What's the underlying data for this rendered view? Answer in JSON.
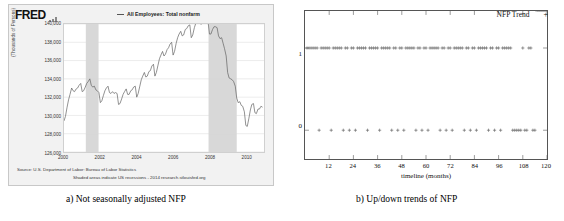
{
  "figure_a": {
    "brand": "FRED",
    "brand_icon": "bar-chart-mark",
    "legend": "All Employees: Total nonfarm",
    "legend_marker": "line-dash",
    "ylabel": "(Thousands of Persons)",
    "yticks": [
      "140,000",
      "138,000",
      "136,000",
      "134,000",
      "132,000",
      "130,000",
      "128,000",
      "126,000"
    ],
    "xticks": [
      "2000",
      "2002",
      "2004",
      "2006",
      "2008",
      "2010"
    ],
    "source_line1": "Source: U.S. Department of Labor: Bureau of Labor Statistics",
    "source_line2": "Shaded areas indicate US recessions - 2014 research.stlouisfed.org",
    "caption": "a) Not seasonally adjusted NFP"
  },
  "figure_b": {
    "legend_label": "NFP Trend",
    "legend_marker": "+",
    "yticks": [
      "1",
      "0"
    ],
    "xticks": [
      "12",
      "24",
      "36",
      "48",
      "60",
      "72",
      "84",
      "96",
      "108",
      "120"
    ],
    "xlabel": "timeline (months)",
    "caption": "b) Up/down trends of NFP"
  },
  "colors": {
    "fred_panel_bg": "#f2f2f2",
    "plot_bg": "#ffffff",
    "series_line": "#555555",
    "recession_band": "#d8d8d8",
    "gridline": "#d9d9d9",
    "frame": "#555555",
    "text": "#111111"
  },
  "chart_data": [
    {
      "type": "line",
      "title": "All Employees: Total nonfarm",
      "xlabel": "",
      "ylabel": "(Thousands of Persons)",
      "ylim": [
        126000,
        140000
      ],
      "xlim": [
        2000.0,
        2011.0
      ],
      "ytick_values": [
        126000,
        128000,
        130000,
        132000,
        134000,
        136000,
        138000,
        140000
      ],
      "xtick_values": [
        2000,
        2002,
        2004,
        2006,
        2008,
        2010
      ],
      "grid": true,
      "legend_position": "top",
      "shaded_regions": [
        {
          "label": "US recession",
          "x0": 2001.2,
          "x1": 2001.9
        },
        {
          "label": "US recession",
          "x0": 2007.95,
          "x1": 2009.5
        }
      ],
      "series": [
        {
          "name": "All Employees: Total nonfarm",
          "x": [
            2000.0,
            2000.08,
            2000.17,
            2000.25,
            2000.33,
            2000.42,
            2000.5,
            2000.58,
            2000.67,
            2000.75,
            2000.83,
            2000.92,
            2001.0,
            2001.08,
            2001.17,
            2001.25,
            2001.33,
            2001.42,
            2001.5,
            2001.58,
            2001.67,
            2001.75,
            2001.83,
            2001.92,
            2002.0,
            2002.08,
            2002.17,
            2002.25,
            2002.33,
            2002.42,
            2002.5,
            2002.58,
            2002.67,
            2002.75,
            2002.83,
            2002.92,
            2003.0,
            2003.08,
            2003.17,
            2003.25,
            2003.33,
            2003.42,
            2003.5,
            2003.58,
            2003.67,
            2003.75,
            2003.83,
            2003.92,
            2004.0,
            2004.08,
            2004.17,
            2004.25,
            2004.33,
            2004.42,
            2004.5,
            2004.58,
            2004.67,
            2004.75,
            2004.83,
            2004.92,
            2005.0,
            2005.08,
            2005.17,
            2005.25,
            2005.33,
            2005.42,
            2005.5,
            2005.58,
            2005.67,
            2005.75,
            2005.83,
            2005.92,
            2006.0,
            2006.08,
            2006.17,
            2006.25,
            2006.33,
            2006.42,
            2006.5,
            2006.58,
            2006.67,
            2006.75,
            2006.83,
            2006.92,
            2007.0,
            2007.08,
            2007.17,
            2007.25,
            2007.33,
            2007.42,
            2007.5,
            2007.58,
            2007.67,
            2007.75,
            2007.83,
            2007.92,
            2008.0,
            2008.08,
            2008.17,
            2008.25,
            2008.33,
            2008.42,
            2008.5,
            2008.58,
            2008.67,
            2008.75,
            2008.83,
            2008.92,
            2009.0,
            2009.08,
            2009.17,
            2009.25,
            2009.33,
            2009.42,
            2009.5,
            2009.58,
            2009.67,
            2009.75,
            2009.83,
            2009.92,
            2010.0,
            2010.08,
            2010.17,
            2010.25,
            2010.33,
            2010.42,
            2010.5,
            2010.58,
            2010.67,
            2010.75,
            2010.83,
            2010.92
          ],
          "y": [
            129400,
            129900,
            130900,
            131700,
            132300,
            133000,
            132700,
            132600,
            132900,
            133000,
            133300,
            133500,
            132600,
            132700,
            133100,
            133500,
            133700,
            134000,
            133300,
            133100,
            133200,
            132800,
            132700,
            132500,
            131400,
            131600,
            132200,
            132700,
            133000,
            133200,
            132500,
            132400,
            132600,
            132400,
            132500,
            132400,
            131200,
            131300,
            131800,
            132300,
            132600,
            132900,
            132300,
            132300,
            132700,
            132800,
            133100,
            133200,
            132000,
            132400,
            133200,
            133900,
            134300,
            134700,
            134200,
            134300,
            134800,
            134900,
            135400,
            135600,
            134300,
            134700,
            135500,
            136200,
            136600,
            137000,
            136500,
            136700,
            137200,
            137400,
            137800,
            138000,
            136600,
            137000,
            137900,
            138500,
            138900,
            139200,
            138700,
            138800,
            139400,
            139500,
            139800,
            139900,
            138500,
            138800,
            139600,
            140100,
            140400,
            140600,
            140000,
            140000,
            140400,
            140300,
            140400,
            140300,
            138900,
            138900,
            139400,
            139700,
            139700,
            139600,
            138700,
            138400,
            138500,
            137900,
            137300,
            136500,
            134700,
            134100,
            134000,
            133900,
            133700,
            133200,
            131900,
            131400,
            131500,
            131100,
            131000,
            130400,
            128900,
            128800,
            129700,
            130600,
            131200,
            131300,
            130300,
            130200,
            130700,
            130700,
            131000,
            130900
          ]
        }
      ]
    },
    {
      "type": "scatter",
      "title": "",
      "xlabel": "timeline (months)",
      "ylabel": "",
      "ylim": [
        -0.35,
        1.45
      ],
      "xlim": [
        0,
        120
      ],
      "ytick_values": [
        0,
        1
      ],
      "xtick_values": [
        12,
        24,
        36,
        48,
        60,
        72,
        84,
        96,
        108,
        120
      ],
      "grid": false,
      "legend_position": "top-right",
      "marker": "+",
      "series": [
        {
          "name": "NFP Trend",
          "x": [
            1,
            2,
            3,
            4,
            5,
            6,
            7,
            8,
            9,
            10,
            11,
            12,
            13,
            14,
            15,
            16,
            17,
            18,
            19,
            20,
            21,
            22,
            23,
            24,
            25,
            26,
            27,
            28,
            29,
            30,
            31,
            32,
            33,
            34,
            35,
            36,
            37,
            38,
            39,
            40,
            41,
            42,
            43,
            44,
            45,
            46,
            47,
            48,
            49,
            50,
            51,
            52,
            53,
            54,
            55,
            56,
            57,
            58,
            59,
            60,
            61,
            62,
            63,
            64,
            65,
            66,
            67,
            68,
            69,
            70,
            71,
            72,
            73,
            74,
            75,
            76,
            77,
            78,
            79,
            80,
            81,
            82,
            83,
            84,
            85,
            86,
            87,
            88,
            89,
            90,
            91,
            92,
            93,
            94,
            95,
            96,
            97,
            98,
            99,
            100,
            101,
            102,
            103,
            104,
            105,
            106,
            107,
            108,
            109,
            110,
            111,
            112,
            113,
            114,
            115,
            116,
            117,
            118,
            119,
            120
          ],
          "y": [
            1,
            1,
            1,
            1,
            1,
            1,
            0,
            1,
            1,
            1,
            1,
            1,
            0,
            1,
            1,
            1,
            1,
            1,
            0,
            1,
            1,
            0,
            1,
            1,
            0,
            1,
            1,
            1,
            1,
            1,
            0,
            1,
            1,
            1,
            1,
            1,
            0,
            1,
            1,
            1,
            1,
            1,
            0,
            1,
            1,
            0,
            1,
            1,
            0,
            1,
            1,
            1,
            1,
            1,
            0,
            1,
            1,
            0,
            1,
            1,
            0,
            1,
            1,
            1,
            1,
            1,
            0,
            1,
            1,
            0,
            1,
            1,
            0,
            1,
            1,
            1,
            1,
            1,
            0,
            1,
            1,
            0,
            1,
            1,
            0,
            1,
            1,
            1,
            1,
            1,
            0,
            1,
            1,
            0,
            1,
            1,
            0,
            1,
            1,
            1,
            1,
            1,
            0,
            0,
            0,
            0,
            0,
            1,
            0,
            0,
            1,
            1,
            0,
            0
          ]
        }
      ]
    }
  ]
}
